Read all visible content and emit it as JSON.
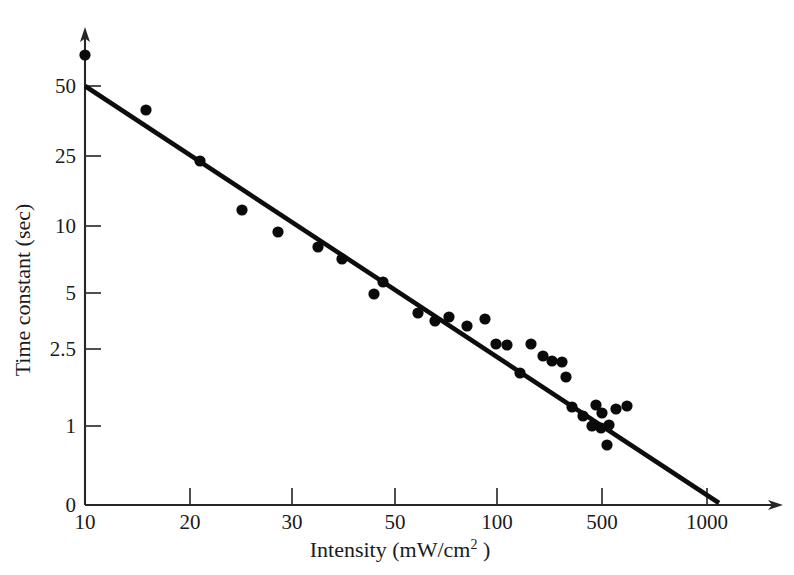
{
  "chart_data": {
    "type": "scatter",
    "title": "",
    "xlabel": "Intensity (mW/cm2 )",
    "xlabel_base": "Intensity (mW/cm",
    "xlabel_sup": "2",
    "xlabel_tail": " )",
    "ylabel": "Time constant (sec)",
    "x_scale": "log-irregular",
    "y_scale": "log-irregular",
    "grid": false,
    "legend": null,
    "x_ticks": [
      {
        "label": "10",
        "value": 10,
        "px": 85
      },
      {
        "label": "20",
        "value": 20,
        "px": 190
      },
      {
        "label": "30",
        "value": 30,
        "px": 292
      },
      {
        "label": "50",
        "value": 50,
        "px": 395
      },
      {
        "label": "100",
        "value": 100,
        "px": 497
      },
      {
        "label": "500",
        "value": 500,
        "px": 602
      },
      {
        "label": "1000",
        "value": 1000,
        "px": 707
      }
    ],
    "y_ticks": [
      {
        "label": "50",
        "value": 50,
        "px": 86
      },
      {
        "label": "25",
        "value": 25,
        "px": 156
      },
      {
        "label": "10",
        "value": 10,
        "px": 226
      },
      {
        "label": "5",
        "value": 5,
        "px": 293
      },
      {
        "label": "2.5",
        "value": 2.5,
        "px": 349
      },
      {
        "label": "1",
        "value": 1,
        "px": 426
      },
      {
        "label": "0",
        "value": 0,
        "px": 505
      }
    ],
    "axis_origin_px": {
      "x": 85,
      "y": 505
    },
    "y_axis_top_px": 30,
    "x_axis_right_px": 782,
    "fit_line": {
      "name": "linear fit",
      "x1_px": 85,
      "y1_px": 86,
      "x2_px": 719,
      "y2_px": 503,
      "start_data": {
        "intensity": 10,
        "time_constant": 50
      },
      "end_data": {
        "intensity": 1050,
        "time_constant": 0.05
      }
    },
    "point_radius_px": 5.6,
    "points_px": [
      {
        "x": 85,
        "y": 55
      },
      {
        "x": 146,
        "y": 110
      },
      {
        "x": 200,
        "y": 161
      },
      {
        "x": 242,
        "y": 210
      },
      {
        "x": 278,
        "y": 232
      },
      {
        "x": 318,
        "y": 247
      },
      {
        "x": 342,
        "y": 259
      },
      {
        "x": 383,
        "y": 282
      },
      {
        "x": 374,
        "y": 294
      },
      {
        "x": 418,
        "y": 313
      },
      {
        "x": 435,
        "y": 321
      },
      {
        "x": 449,
        "y": 317
      },
      {
        "x": 467,
        "y": 326
      },
      {
        "x": 485,
        "y": 319
      },
      {
        "x": 496,
        "y": 344
      },
      {
        "x": 507,
        "y": 345
      },
      {
        "x": 520,
        "y": 373
      },
      {
        "x": 531,
        "y": 344
      },
      {
        "x": 543,
        "y": 356
      },
      {
        "x": 552,
        "y": 361
      },
      {
        "x": 562,
        "y": 362
      },
      {
        "x": 566,
        "y": 377
      },
      {
        "x": 572,
        "y": 407
      },
      {
        "x": 583,
        "y": 416
      },
      {
        "x": 592,
        "y": 426
      },
      {
        "x": 596,
        "y": 405
      },
      {
        "x": 602,
        "y": 413
      },
      {
        "x": 601,
        "y": 428
      },
      {
        "x": 609,
        "y": 425
      },
      {
        "x": 616,
        "y": 409
      },
      {
        "x": 607,
        "y": 445
      },
      {
        "x": 627,
        "y": 406
      }
    ],
    "points_data": [
      {
        "intensity": 10,
        "time_constant": 72
      },
      {
        "intensity": 15,
        "time_constant": 40
      },
      {
        "intensity": 21,
        "time_constant": 24
      },
      {
        "intensity": 25,
        "time_constant": 13
      },
      {
        "intensity": 28,
        "time_constant": 9.8
      },
      {
        "intensity": 33,
        "time_constant": 8.2
      },
      {
        "intensity": 38,
        "time_constant": 7.3
      },
      {
        "intensity": 46,
        "time_constant": 5.7
      },
      {
        "intensity": 44,
        "time_constant": 5.0
      },
      {
        "intensity": 60,
        "time_constant": 3.9
      },
      {
        "intensity": 68,
        "time_constant": 3.5
      },
      {
        "intensity": 75,
        "time_constant": 3.7
      },
      {
        "intensity": 85,
        "time_constant": 3.3
      },
      {
        "intensity": 95,
        "time_constant": 3.6
      },
      {
        "intensity": 105,
        "time_constant": 2.6
      },
      {
        "intensity": 120,
        "time_constant": 2.6
      },
      {
        "intensity": 140,
        "time_constant": 2.0
      },
      {
        "intensity": 155,
        "time_constant": 2.6
      },
      {
        "intensity": 175,
        "time_constant": 2.3
      },
      {
        "intensity": 195,
        "time_constant": 2.2
      },
      {
        "intensity": 215,
        "time_constant": 2.2
      },
      {
        "intensity": 225,
        "time_constant": 2.0
      },
      {
        "intensity": 240,
        "time_constant": 1.4
      },
      {
        "intensity": 290,
        "time_constant": 1.3
      },
      {
        "intensity": 340,
        "time_constant": 1.1
      },
      {
        "intensity": 360,
        "time_constant": 1.5
      },
      {
        "intensity": 390,
        "time_constant": 1.4
      },
      {
        "intensity": 385,
        "time_constant": 1.1
      },
      {
        "intensity": 430,
        "time_constant": 1.2
      },
      {
        "intensity": 470,
        "time_constant": 1.4
      },
      {
        "intensity": 420,
        "time_constant": 0.8
      },
      {
        "intensity": 540,
        "time_constant": 1.4
      }
    ]
  },
  "colors": {
    "background": "#ffffff",
    "axis": "#262626",
    "point": "#0a0a0a",
    "fit_line": "#0d0d0d",
    "text": "#1a1a1a"
  }
}
